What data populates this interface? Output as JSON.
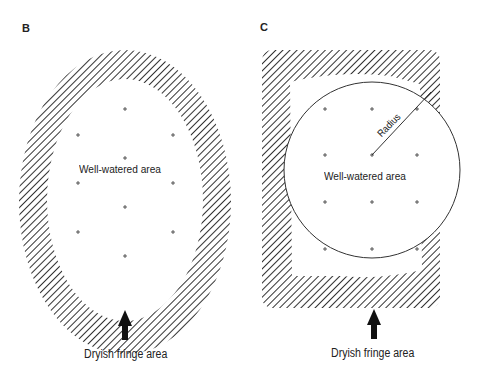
{
  "panels": [
    {
      "id": "B",
      "label": "B",
      "shape": "oval",
      "inner_label": "Well-watered area",
      "fringe_label": "Dryish fringe area"
    },
    {
      "id": "C",
      "label": "C",
      "shape": "rounded-square with inscribed circle",
      "inner_label": "Well-watered area",
      "radius_label": "Radius",
      "fringe_label": "Dryish fringe area"
    }
  ],
  "colors": {
    "hatch": "#333333",
    "background": "#ffffff",
    "text": "#222222"
  }
}
